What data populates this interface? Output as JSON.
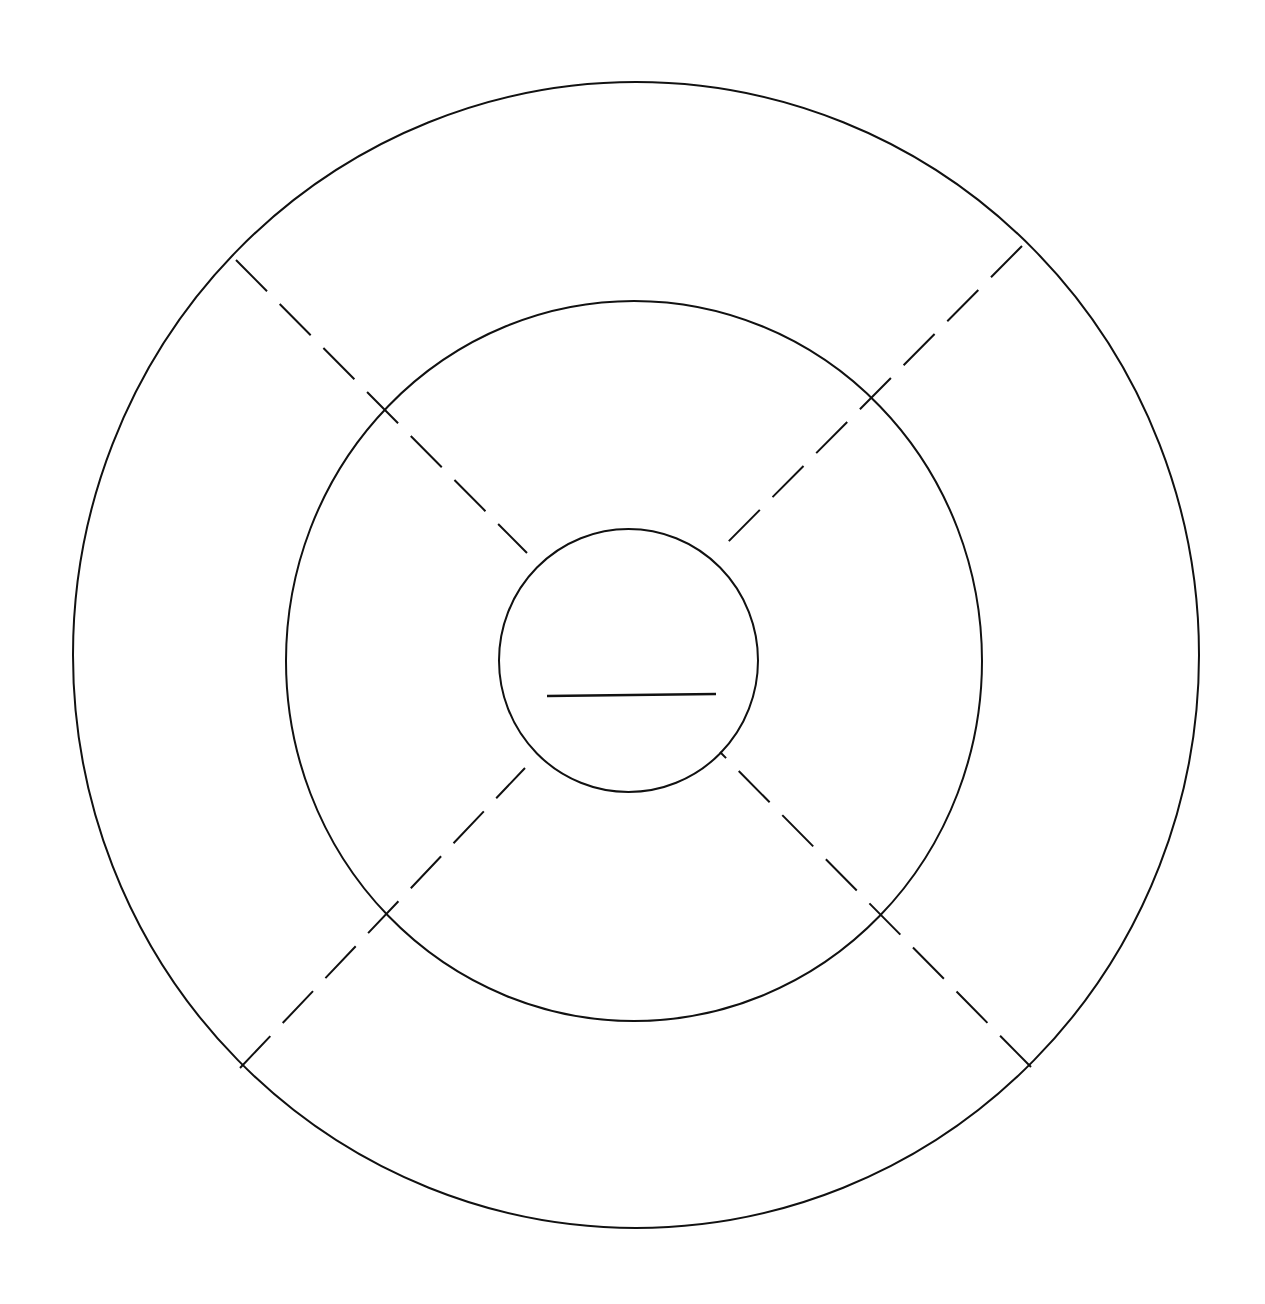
{
  "diagram": {
    "type": "concentric-target-diagram",
    "background_color": "#ffffff",
    "stroke_color": "#111111",
    "rings": [
      {
        "name": "outer-ring",
        "cx": 636,
        "cy": 655,
        "rx": 563,
        "ry": 573
      },
      {
        "name": "middle-ring",
        "cx": 634,
        "cy": 661,
        "rx": 348,
        "ry": 360
      },
      {
        "name": "inner-ring",
        "cx": 628.5,
        "cy": 660.5,
        "rx": 129.5,
        "ry": 131.5
      }
    ],
    "dashed_dividers": [
      {
        "name": "divider-top-left",
        "x1": 236,
        "y1": 260,
        "x2": 527,
        "y2": 553
      },
      {
        "name": "divider-top-right",
        "x1": 1022,
        "y1": 246,
        "x2": 720,
        "y2": 550
      },
      {
        "name": "divider-bottom-left",
        "x1": 240,
        "y1": 1068,
        "x2": 525,
        "y2": 768
      },
      {
        "name": "divider-bottom-right",
        "x1": 1031,
        "y1": 1067,
        "x2": 720,
        "y2": 752
      }
    ],
    "center_line": {
      "x1": 547,
      "y1": 696,
      "x2": 716,
      "y2": 694
    },
    "labels": []
  }
}
